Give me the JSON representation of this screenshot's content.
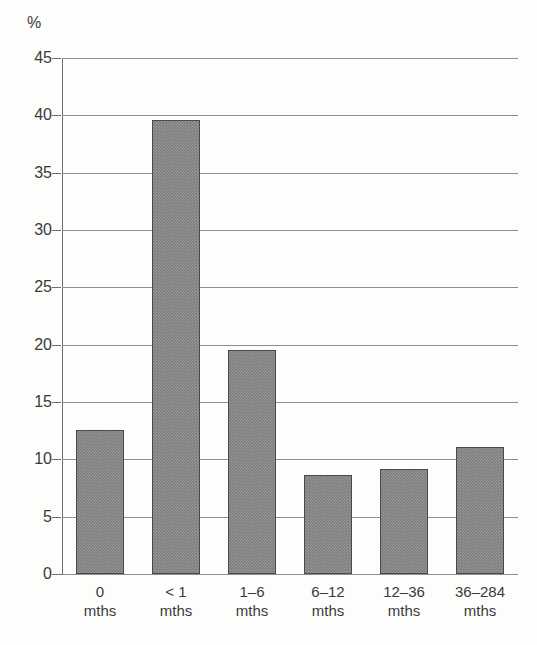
{
  "chart_data": {
    "type": "bar",
    "title": "",
    "subtitle": "",
    "xlabel": "",
    "ylabel": "%",
    "unit_label": "%",
    "categories": [
      "0",
      "< 1",
      "1–6",
      "6–12",
      "12–36",
      "36–284"
    ],
    "category_suffix": "mths",
    "category_labels": [
      {
        "line1": "0",
        "line2": "mths"
      },
      {
        "line1": "< 1",
        "line2": "mths"
      },
      {
        "line1": "1–6",
        "line2": "mths"
      },
      {
        "line1": "6–12",
        "line2": "mths"
      },
      {
        "line1": "12–36",
        "line2": "mths"
      },
      {
        "line1": "36–284",
        "line2": "mths"
      }
    ],
    "values": [
      12.6,
      39.6,
      19.5,
      8.6,
      9.2,
      11.1
    ],
    "ylim": [
      0,
      45
    ],
    "ytick_step": 5,
    "ytick_labels": [
      "45",
      "40",
      "35",
      "30",
      "25",
      "20",
      "15",
      "10",
      "5",
      "0"
    ],
    "ytick_values": [
      45,
      40,
      35,
      30,
      25,
      20,
      15,
      10,
      5,
      0
    ],
    "grid": true,
    "grid_axis": "y",
    "legend": false,
    "legend_position": "none",
    "bar_color": "#7c7c7c",
    "bar_edge_color": "#4a4a4a",
    "grid_color": "#8d8d8d",
    "axis_color": "#6e6e6e",
    "text_color": "#3a3a3a",
    "background_color": "#fdfdfc"
  }
}
